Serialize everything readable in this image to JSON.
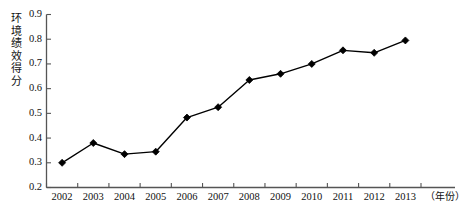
{
  "chart_data": {
    "type": "line",
    "title": "",
    "xlabel": "（年份）",
    "ylabel": "环境绩效得分",
    "categories": [
      "2002",
      "2003",
      "2004",
      "2005",
      "2006",
      "2007",
      "2008",
      "2009",
      "2010",
      "2011",
      "2012",
      "2013"
    ],
    "values": [
      0.3,
      0.38,
      0.335,
      0.345,
      0.483,
      0.525,
      0.635,
      0.66,
      0.7,
      0.755,
      0.745,
      0.795
    ],
    "series": [
      {
        "name": "环境绩效得分",
        "values": [
          0.3,
          0.38,
          0.335,
          0.345,
          0.483,
          0.525,
          0.635,
          0.66,
          0.7,
          0.755,
          0.745,
          0.795
        ]
      }
    ],
    "ylim": [
      0.2,
      0.9
    ],
    "ytick_step": 0.1,
    "yticks": [
      "0.9",
      "0.8",
      "0.7",
      "0.6",
      "0.5",
      "0.4",
      "0.3",
      "0.2"
    ],
    "ytick_values": [
      0.9,
      0.8,
      0.7,
      0.6,
      0.5,
      0.4,
      0.3,
      0.2
    ],
    "grid": false,
    "legend": "none",
    "marker": "diamond",
    "line_color": "#000000",
    "marker_color": "#000000",
    "axis_color": "#555555",
    "background_color": "#ffffff"
  },
  "axis": {
    "y_title_chars": "环境绩效得分",
    "x_unit_label": "（年份）"
  }
}
